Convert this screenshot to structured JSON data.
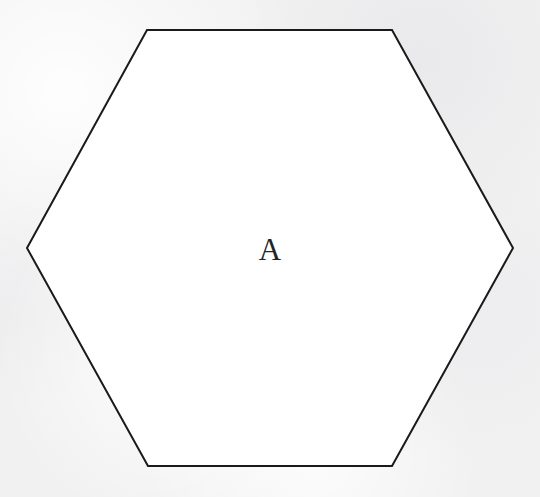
{
  "figure": {
    "canvas": {
      "width": 540,
      "height": 497,
      "background_color": "#f1f1f2",
      "texture": "paper-grain"
    },
    "shape": {
      "name": "hexagon",
      "sides": 6,
      "label": "A",
      "fill_color": "#ffffff",
      "stroke_color": "#1a1a1a",
      "stroke_width": 2,
      "label_color": "#242424",
      "label_font_size": 31,
      "label_x": 270,
      "label_y": 260,
      "center_x": 270,
      "center_y": 248,
      "points": "147,30 392,30 513,248 392,466 148,466 27,248",
      "vertices": [
        {
          "name": "top-left",
          "x": 147,
          "y": 30
        },
        {
          "name": "top-right",
          "x": 392,
          "y": 30
        },
        {
          "name": "right",
          "x": 513,
          "y": 248
        },
        {
          "name": "bottom-right",
          "x": 392,
          "y": 466
        },
        {
          "name": "bottom-left",
          "x": 148,
          "y": 466
        },
        {
          "name": "left",
          "x": 27,
          "y": 248
        }
      ]
    }
  }
}
